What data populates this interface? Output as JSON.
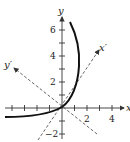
{
  "diagram": {
    "axes": {
      "x_label": "x",
      "y_label": "y",
      "x_prime_label": "x′",
      "y_prime_label": "y′"
    },
    "x_tick_labels": [
      "2",
      "4"
    ],
    "y_tick_labels": [
      "6",
      "4",
      "2",
      "−2"
    ],
    "colors": {
      "axis": "#333333",
      "curve": "#111111",
      "rotated_axes": "#555555"
    }
  }
}
